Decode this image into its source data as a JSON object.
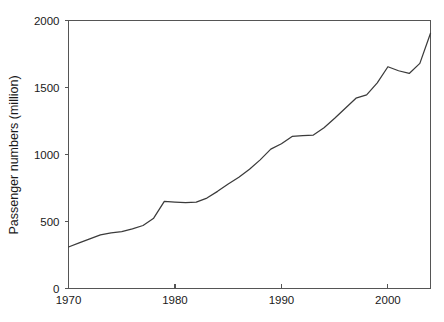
{
  "chart_data": {
    "type": "line",
    "title": "",
    "xlabel": "",
    "ylabel": "Passenger numbers (million)",
    "xlim": [
      1970,
      2004
    ],
    "ylim": [
      0,
      2000
    ],
    "grid": false,
    "legend": null,
    "x_ticks": [
      1970,
      1980,
      1990,
      2000
    ],
    "x_tick_labels": [
      "1970",
      "1980",
      "1990",
      "2000"
    ],
    "y_ticks": [
      0,
      500,
      1000,
      1500,
      2000
    ],
    "y_tick_labels": [
      "0",
      "500",
      "1000",
      "1500",
      "2000"
    ],
    "line_color": "#3b3b3b",
    "axis_color": "#555555",
    "x": [
      1970,
      1971,
      1972,
      1973,
      1974,
      1975,
      1976,
      1977,
      1978,
      1979,
      1980,
      1981,
      1982,
      1983,
      1984,
      1985,
      1986,
      1987,
      1988,
      1989,
      1990,
      1991,
      1992,
      1993,
      1994,
      1995,
      1996,
      1997,
      1998,
      1999,
      2000,
      2001,
      2002,
      2003,
      2004
    ],
    "values": [
      310,
      340,
      370,
      400,
      415,
      425,
      445,
      470,
      525,
      650,
      645,
      640,
      645,
      675,
      725,
      780,
      830,
      890,
      960,
      1040,
      1080,
      1135,
      1140,
      1145,
      1200,
      1270,
      1345,
      1420,
      1445,
      1535,
      1655,
      1625,
      1605,
      1680,
      1905
    ]
  },
  "axis": {
    "y_title": "Passenger numbers (million)"
  }
}
